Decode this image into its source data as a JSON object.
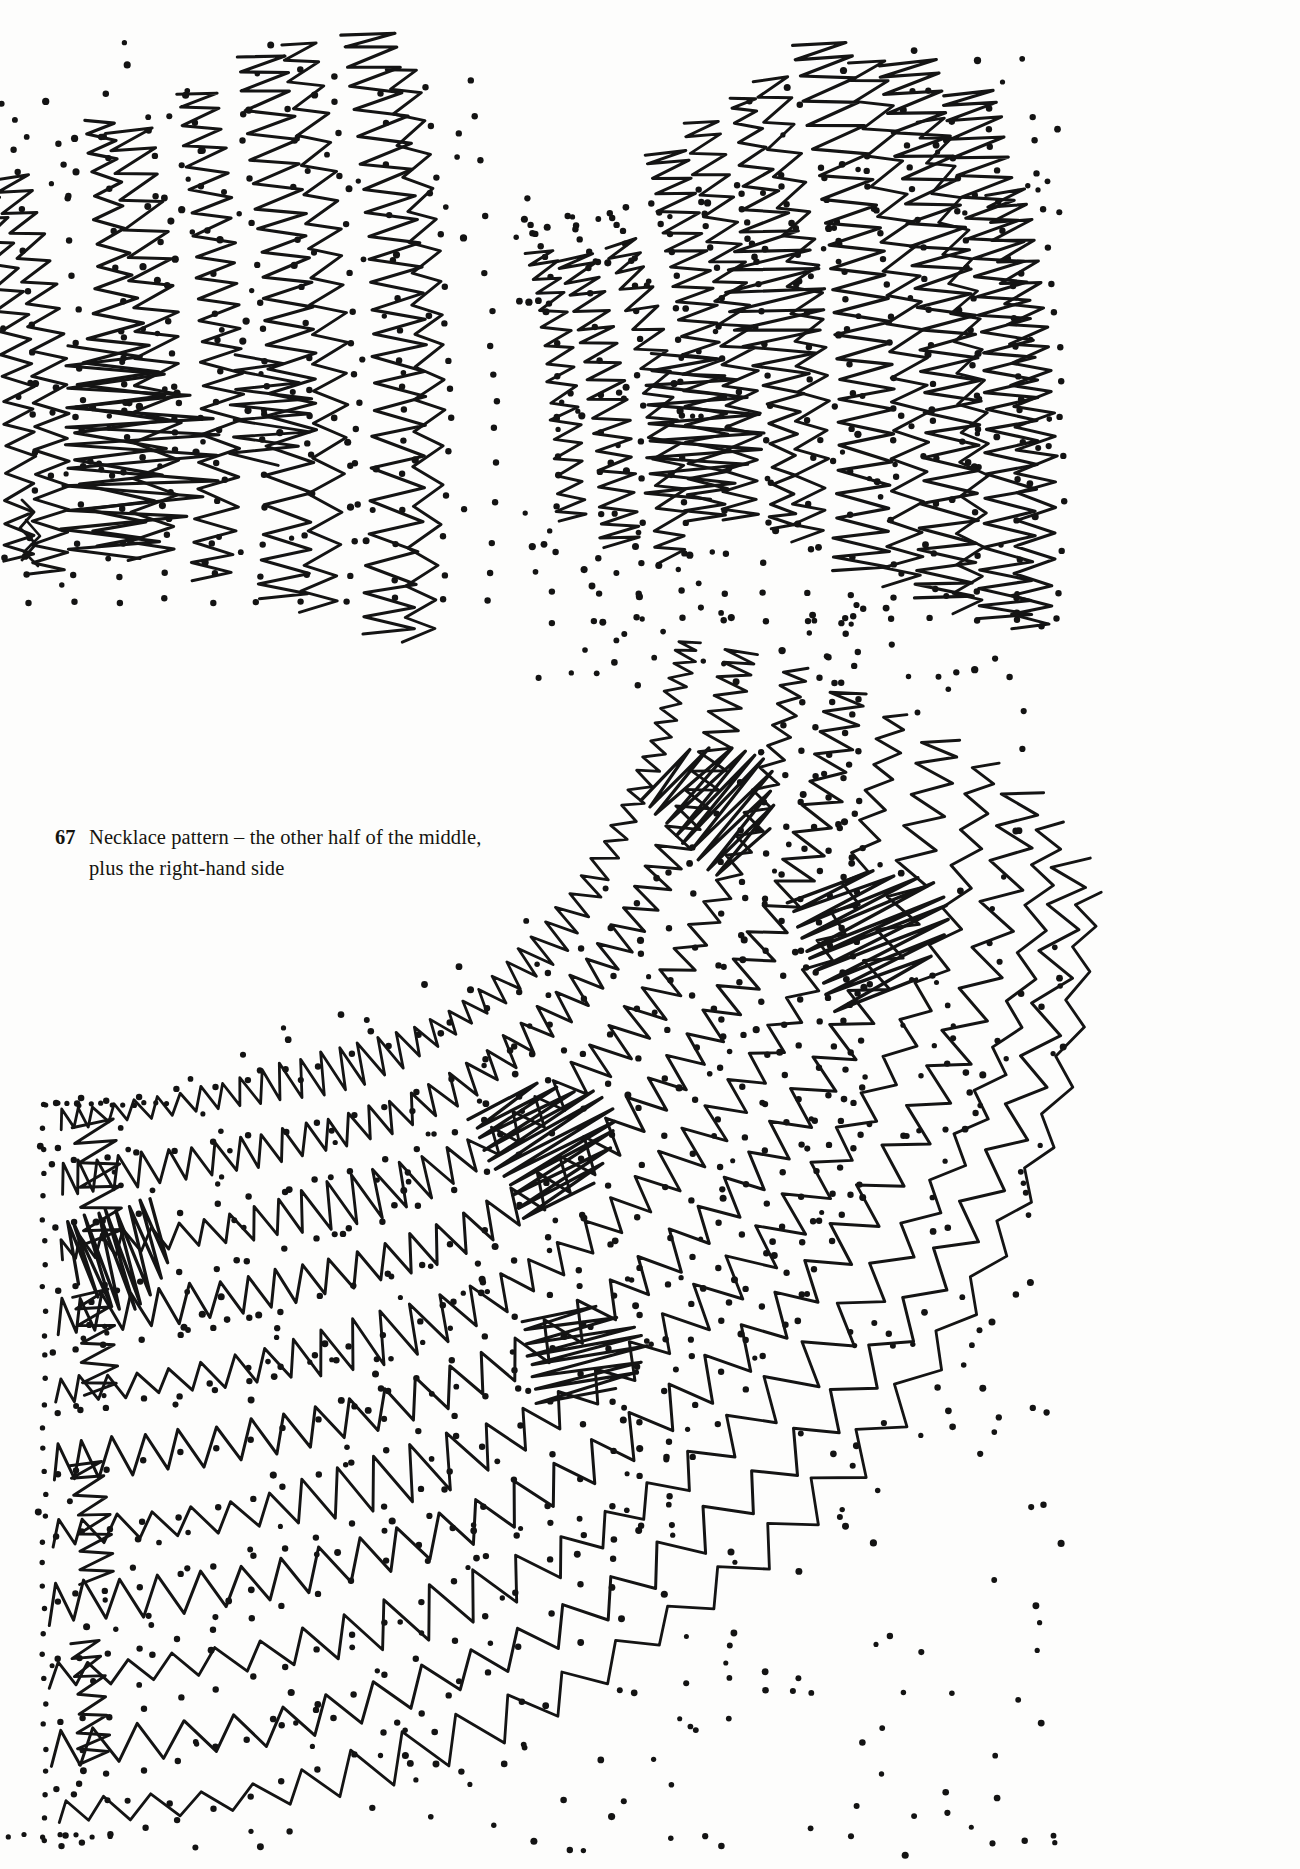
{
  "page": {
    "background_color": "#fdfdfc",
    "ink_color": "#141414",
    "width": 1300,
    "height": 1869
  },
  "caption": {
    "number": "67",
    "line1": "Necklace pattern – the other half of the middle,",
    "line2": "plus the right-hand side",
    "full_text": "67  Necklace pattern – the other half of the middle, plus the right-hand side"
  },
  "figure": {
    "name": "necklace-lace-pricking-diagram",
    "regions": [
      {
        "id": "upper-left-panel",
        "label": "other half of the middle"
      },
      {
        "id": "right-panel",
        "label": "right-hand side"
      },
      {
        "id": "lower-curved-panel",
        "label": "curved lower band"
      }
    ],
    "marks": {
      "zigzag_stroke_color": "#141414",
      "dot_color": "#131313",
      "dot_radius_px": 3.1,
      "boundary_style": "dotted"
    }
  },
  "chart_data": {
    "type": "scatter",
    "title": "Necklace pattern – the other half of the middle, plus the right-hand side",
    "xlabel": "",
    "ylabel": "",
    "grid": false,
    "legend": "none"
  }
}
